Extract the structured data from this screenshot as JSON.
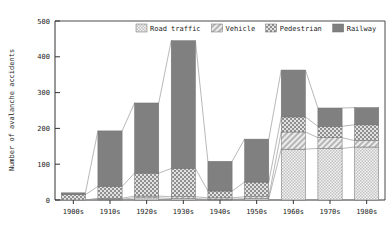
{
  "chart_data": {
    "type": "bar",
    "stacked": true,
    "title": "",
    "xlabel": "",
    "ylabel": "Number of avalanche accidents",
    "ylim": [
      0,
      500
    ],
    "yticks": [
      0,
      100,
      200,
      300,
      400,
      500
    ],
    "grid": false,
    "legend_position": "top-right",
    "categories": [
      "1900s",
      "1910s",
      "1920s",
      "1930s",
      "1940s",
      "1950s",
      "1960s",
      "1970s",
      "1980s"
    ],
    "series": [
      {
        "name": "Road traffic",
        "pattern": "fine-checker-light",
        "color": "#d9d9d9",
        "values": [
          0,
          2,
          6,
          4,
          2,
          4,
          142,
          144,
          148
        ]
      },
      {
        "name": "Vehicle",
        "pattern": "diagonal-hatch",
        "color": "#c8c8c8",
        "values": [
          0,
          3,
          5,
          5,
          4,
          5,
          48,
          30,
          18
        ]
      },
      {
        "name": "Pedestrian",
        "pattern": "coarse-checker",
        "color": "#a8a8a8",
        "values": [
          15,
          33,
          64,
          79,
          19,
          41,
          42,
          32,
          44
        ]
      },
      {
        "name": "Railway",
        "pattern": "solid-gray",
        "color": "#808080",
        "values": [
          5,
          155,
          196,
          357,
          83,
          120,
          131,
          51,
          48
        ]
      }
    ],
    "totals": [
      20,
      193,
      271,
      445,
      108,
      170,
      363,
      257,
      258
    ]
  },
  "legend": {
    "items": [
      {
        "label": "Road traffic",
        "swatch": "road-traffic-swatch"
      },
      {
        "label": "Vehicle",
        "swatch": "vehicle-swatch"
      },
      {
        "label": "Pedestrian",
        "swatch": "pedestrian-swatch"
      },
      {
        "label": "Railway",
        "swatch": "railway-swatch"
      }
    ]
  },
  "axes": {
    "y_title": "Number of avalanche accidents",
    "y_ticks": [
      "0",
      "100",
      "200",
      "300",
      "400",
      "500"
    ],
    "x_ticks": [
      "1900s",
      "1910s",
      "1920s",
      "1930s",
      "1940s",
      "1950s",
      "1960s",
      "1970s",
      "1980s"
    ]
  },
  "colors": {
    "axis": "#333333",
    "plot_border": "#4a4a4a",
    "road_traffic": "#d9d9d9",
    "vehicle": "#c8c8c8",
    "pedestrian": "#a8a8a8",
    "railway": "#808080",
    "connector": "#9a9a9a"
  }
}
